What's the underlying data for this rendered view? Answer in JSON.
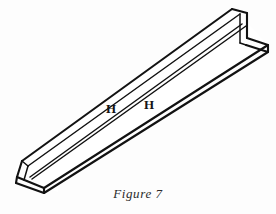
{
  "figure": {
    "caption": "Figure 7",
    "background_color": "#fdfdfd",
    "line_color": "#121212",
    "fill_color": "#ffffff",
    "labels": [
      {
        "text": "H",
        "location": "vertical web, left of center"
      },
      {
        "text": "H",
        "location": "vertical web, right of center"
      }
    ],
    "annotations": {
      "web_label_1": "H",
      "web_label_2": "H"
    },
    "geometry": {
      "orientation": "runs from lower-left (near end) to upper-right (far end)",
      "cross_section": "L / angle profile with vertical web and horizontal flange",
      "near_end_corner": "bottom-left",
      "far_end_corner": "top-right"
    }
  }
}
